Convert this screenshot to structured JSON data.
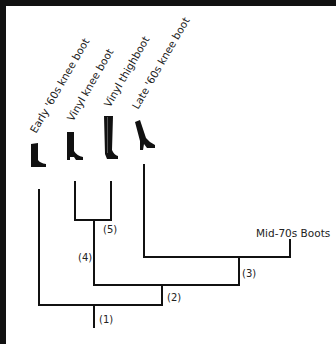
{
  "diagram": {
    "type": "cladogram",
    "leaves": [
      {
        "id": "early60s",
        "label": "Early '60s knee boot",
        "icon": "knee-boot-icon"
      },
      {
        "id": "vinylknee",
        "label": "Vinyl knee boot",
        "icon": "knee-boot-icon"
      },
      {
        "id": "vinylthigh",
        "label": "Vinyl thighboot",
        "icon": "thigh-boot-icon"
      },
      {
        "id": "late60s",
        "label": "Late '60s knee boot",
        "icon": "heeled-knee-boot-icon"
      }
    ],
    "terminal": {
      "label": "Mid-70s Boots"
    },
    "nodes": [
      {
        "id": "n1",
        "label": "(1)"
      },
      {
        "id": "n2",
        "label": "(2)"
      },
      {
        "id": "n3",
        "label": "(3)"
      },
      {
        "id": "n4",
        "label": "(4)"
      },
      {
        "id": "n5",
        "label": "(5)"
      }
    ],
    "colors": {
      "line": "#111111",
      "text": "#222222",
      "background": "#ffffff",
      "frame": "#111111"
    }
  }
}
